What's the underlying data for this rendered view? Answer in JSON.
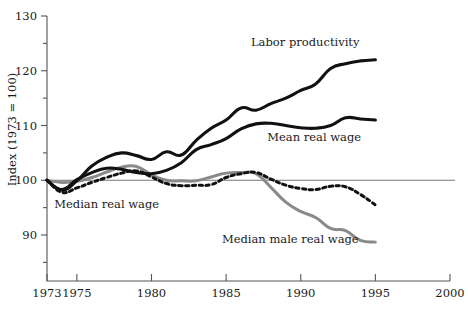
{
  "chart_data": {
    "type": "line",
    "title": "",
    "xlabel": "",
    "ylabel": "Index (1973 = 100)",
    "xlim": [
      1973,
      2000
    ],
    "ylim": [
      85.5,
      130
    ],
    "grid": false,
    "legend_position": "inline-annotations",
    "reference_line": 100,
    "x_ticks": [
      1973,
      1975,
      1980,
      1985,
      1990,
      1995,
      2000
    ],
    "x_tick_labels": [
      "1973",
      "1975",
      "1980",
      "1985",
      "1990",
      "1995",
      "2000"
    ],
    "y_ticks": [
      90,
      100,
      110,
      120,
      130
    ],
    "y_tick_labels": [
      "90",
      "100",
      "110",
      "120",
      "130"
    ],
    "y_minor_ticks": [
      85,
      95,
      105,
      115,
      125
    ],
    "series": [
      {
        "name": "Labor productivity",
        "style": "solid-black-thick",
        "color": "#111111",
        "x": [
          1973,
          1974,
          1975,
          1976,
          1977,
          1978,
          1979,
          1980,
          1981,
          1982,
          1983,
          1984,
          1985,
          1986,
          1987,
          1988,
          1989,
          1990,
          1991,
          1992,
          1993,
          1994,
          1995
        ],
        "values": [
          100.0,
          98.2,
          99.9,
          102.6,
          104.2,
          105.0,
          104.5,
          103.8,
          105.2,
          104.6,
          107.3,
          109.5,
          111.0,
          113.2,
          112.8,
          114.0,
          115.0,
          116.4,
          117.6,
          120.4,
          121.3,
          121.8,
          122.0
        ]
      },
      {
        "name": "Mean real wage",
        "style": "solid-black-thick",
        "color": "#111111",
        "x": [
          1973,
          1974,
          1975,
          1976,
          1977,
          1978,
          1979,
          1980,
          1981,
          1982,
          1983,
          1984,
          1985,
          1986,
          1987,
          1988,
          1989,
          1990,
          1991,
          1992,
          1993,
          1994,
          1995
        ],
        "values": [
          100.0,
          98.3,
          100.1,
          101.4,
          102.2,
          102.0,
          101.4,
          101.2,
          101.8,
          103.2,
          105.6,
          106.5,
          107.6,
          109.4,
          110.3,
          110.4,
          110.0,
          109.6,
          109.5,
          110.0,
          111.4,
          111.2,
          111.0
        ]
      },
      {
        "name": "Median real wage",
        "style": "dotted-black",
        "color": "#111111",
        "x": [
          1973,
          1974,
          1975,
          1976,
          1977,
          1978,
          1979,
          1980,
          1981,
          1982,
          1983,
          1984,
          1985,
          1986,
          1987,
          1988,
          1989,
          1990,
          1991,
          1992,
          1993,
          1994,
          1995
        ],
        "values": [
          100.0,
          97.8,
          98.6,
          99.6,
          100.5,
          101.3,
          101.7,
          100.6,
          99.4,
          99.0,
          99.1,
          99.2,
          100.5,
          101.2,
          101.4,
          100.2,
          99.1,
          98.5,
          98.3,
          98.9,
          98.8,
          97.4,
          95.5
        ]
      },
      {
        "name": "Median male real wage",
        "style": "solid-gray",
        "color": "#8a8a8a",
        "x": [
          1973,
          1974,
          1975,
          1976,
          1977,
          1978,
          1979,
          1980,
          1981,
          1982,
          1983,
          1984,
          1985,
          1986,
          1987,
          1988,
          1989,
          1990,
          1991,
          1992,
          1993,
          1994,
          1995
        ],
        "values": [
          100.0,
          99.6,
          99.8,
          100.5,
          101.5,
          102.4,
          102.5,
          101.0,
          100.0,
          99.9,
          99.9,
          100.6,
          101.3,
          101.4,
          101.2,
          98.7,
          96.0,
          94.3,
          93.2,
          91.2,
          90.8,
          89.0,
          88.7
        ]
      }
    ],
    "annotations": [
      {
        "text": "Labor productivity",
        "x": 1990.3,
        "y": 124.6
      },
      {
        "text": "Mean real wage",
        "x": 1990.9,
        "y": 107.1
      },
      {
        "text": "Median real wage",
        "x": 1977.0,
        "y": 95.0
      },
      {
        "text": "Median male real wage",
        "x": 1989.3,
        "y": 88.6
      }
    ]
  },
  "axis": {
    "y_title": "Index (1973 = 100)"
  }
}
